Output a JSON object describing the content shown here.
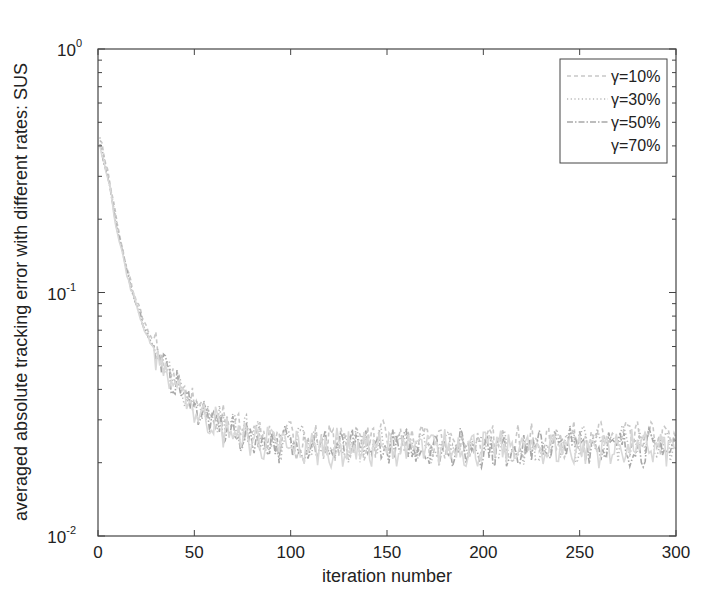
{
  "chart_data": {
    "type": "line",
    "title": "",
    "xlabel": "iteration number",
    "ylabel": "averaged absolute tracking error with different rates: SUS",
    "xlim": [
      0,
      300
    ],
    "ylim": [
      0.01,
      1
    ],
    "yscale": "log",
    "grid": false,
    "legend_position": "upper right",
    "x_ticks": [
      0,
      50,
      100,
      150,
      200,
      250,
      300
    ],
    "y_ticks": [
      {
        "base": "10",
        "exp": "0"
      },
      {
        "base": "10",
        "exp": "-1"
      },
      {
        "base": "10",
        "exp": "-2"
      }
    ],
    "x": [
      1,
      5,
      10,
      15,
      20,
      25,
      30,
      35,
      40,
      45,
      50,
      60,
      70,
      80,
      90,
      100,
      125,
      150,
      175,
      200,
      225,
      250,
      275,
      300
    ],
    "series": [
      {
        "name": "γ=10%",
        "style": "dashed",
        "color": "#c8c8c8",
        "values": [
          0.43,
          0.32,
          0.19,
          0.125,
          0.092,
          0.072,
          0.06,
          0.05,
          0.044,
          0.04,
          0.036,
          0.031,
          0.028,
          0.027,
          0.026,
          0.025,
          0.024,
          0.025,
          0.024,
          0.024,
          0.024,
          0.025,
          0.025,
          0.025
        ]
      },
      {
        "name": "γ=30%",
        "style": "dotted",
        "color": "#b8b8b8",
        "values": [
          0.42,
          0.31,
          0.185,
          0.122,
          0.09,
          0.07,
          0.058,
          0.049,
          0.043,
          0.039,
          0.035,
          0.03,
          0.027,
          0.026,
          0.025,
          0.024,
          0.024,
          0.024,
          0.023,
          0.024,
          0.023,
          0.024,
          0.024,
          0.024
        ]
      },
      {
        "name": "γ=50%",
        "style": "dash-dot",
        "color": "#a8a8a8",
        "values": [
          0.41,
          0.3,
          0.18,
          0.12,
          0.089,
          0.069,
          0.057,
          0.048,
          0.042,
          0.038,
          0.034,
          0.029,
          0.026,
          0.025,
          0.024,
          0.024,
          0.023,
          0.023,
          0.023,
          0.023,
          0.023,
          0.024,
          0.023,
          0.023
        ]
      },
      {
        "name": "γ=70%",
        "style": "solid",
        "color": "#d8d8d8",
        "values": [
          0.4,
          0.3,
          0.18,
          0.118,
          0.088,
          0.068,
          0.056,
          0.047,
          0.041,
          0.037,
          0.033,
          0.029,
          0.026,
          0.025,
          0.024,
          0.023,
          0.023,
          0.023,
          0.023,
          0.023,
          0.023,
          0.023,
          0.023,
          0.023
        ]
      }
    ]
  },
  "legend": {
    "items": [
      "γ=10%",
      "γ=30%",
      "γ=50%",
      "γ=70%"
    ]
  }
}
